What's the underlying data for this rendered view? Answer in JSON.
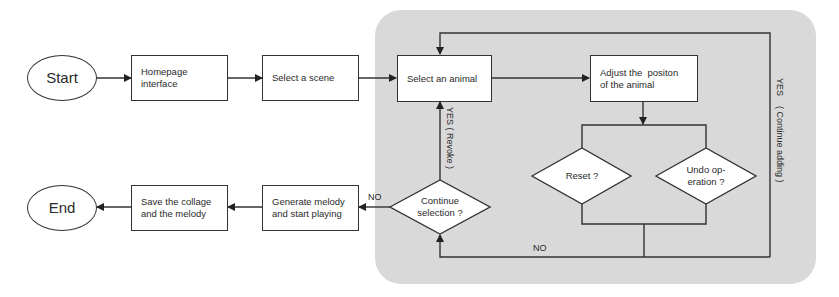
{
  "diagram": {
    "type": "flowchart",
    "nodes": {
      "start": {
        "label": "Start",
        "shape": "oval"
      },
      "homepage": {
        "label": "Homepage interface",
        "shape": "rect"
      },
      "select_scene": {
        "label": "Select a scene",
        "shape": "rect"
      },
      "select_animal": {
        "label": "Select an animal",
        "shape": "rect"
      },
      "adjust_position": {
        "label": "Adjust the  positon of the animal",
        "shape": "rect"
      },
      "reset": {
        "label": "Reset ?",
        "shape": "diamond"
      },
      "undo": {
        "label": "Undo op-eration ?",
        "shape": "diamond"
      },
      "continue_selection": {
        "label": "Continue selection ?",
        "shape": "diamond"
      },
      "generate_melody": {
        "label": "Generate melody and start playing",
        "shape": "rect"
      },
      "save": {
        "label": "Save the collage and the melody",
        "shape": "rect"
      },
      "end": {
        "label": "End",
        "shape": "oval"
      }
    },
    "edge_labels": {
      "yes_revoke": "YES ( Revoke )",
      "yes_continue_adding": "YES    ( Continue adding )",
      "no_bottom": "NO",
      "no_left": "NO"
    },
    "edges": [
      {
        "from": "Start",
        "to": "Homepage interface"
      },
      {
        "from": "Homepage interface",
        "to": "Select a scene"
      },
      {
        "from": "Select a scene",
        "to": "Select an animal"
      },
      {
        "from": "Select an animal",
        "to": "Adjust the positon of the animal"
      },
      {
        "from": "Adjust the positon of the animal",
        "to": "Reset ? / Undo operation ?"
      },
      {
        "from": "Reset ? / Undo operation ?",
        "to": "Continue selection ?",
        "label": "NO"
      },
      {
        "from": "Reset ? / Undo operation ?",
        "to": "Select an animal",
        "label": "YES ( Continue adding )"
      },
      {
        "from": "Continue selection ?",
        "to": "Select an animal",
        "label": "YES ( Revoke )"
      },
      {
        "from": "Continue selection ?",
        "to": "Generate melody and start playing",
        "label": "NO"
      },
      {
        "from": "Generate melody and start playing",
        "to": "Save the collage and the melody"
      },
      {
        "from": "Save the collage and the melody",
        "to": "End"
      }
    ],
    "text_lines": {
      "homepage": [
        "Homepage",
        "interface"
      ],
      "adjust": [
        "Adjust the  positon",
        "of the animal"
      ],
      "undo": [
        "Undo op-",
        "eration ?"
      ],
      "continue": [
        "Continue",
        "selection ?"
      ],
      "generate": [
        "Generate melody",
        "and start playing"
      ],
      "save": [
        "Save the collage",
        "and the melody"
      ]
    },
    "colors": {
      "panel": "#d9d9d9",
      "stroke": "#333333",
      "node_fill": "#ffffff",
      "text": "#2a2a2a"
    }
  }
}
